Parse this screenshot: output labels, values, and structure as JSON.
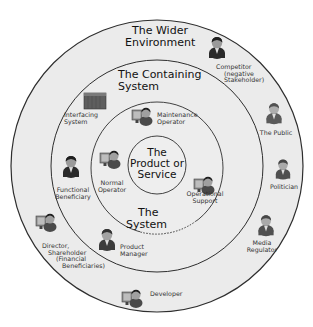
{
  "diagram": {
    "type": "onion-stakeholder-diagram",
    "colors": {
      "background": "#ffffff",
      "ring_fill": "#ebebeb",
      "ring_stroke": "#333333",
      "person_dark": "#2a2a2a",
      "person_mid": "#5a5a5a",
      "face": "#9a9a9a",
      "computer": "#7a7a7a"
    },
    "rings": [
      {
        "id": "wider",
        "title_line1": "The Wider",
        "title_line2": "Environment"
      },
      {
        "id": "containing",
        "title_line1": "The Containing",
        "title_line2": "System"
      },
      {
        "id": "system",
        "title_line1": "The",
        "title_line2": "System"
      },
      {
        "id": "core",
        "title_line1": "The",
        "title_line2": "Product or",
        "title_line3": "Service"
      }
    ],
    "stakeholders": {
      "competitor": {
        "line1": "Competitor",
        "line2": "(negative",
        "line3": "Stakeholder)",
        "icon": "person-icon"
      },
      "public": {
        "line1": "The Public",
        "icon": "person-icon"
      },
      "politician": {
        "line1": "Politician",
        "icon": "person-icon"
      },
      "media_regulator": {
        "line1": "Media",
        "line2": "Regulator",
        "icon": "person-icon"
      },
      "developer": {
        "line1": "Developer",
        "icon": "person-at-computer-icon"
      },
      "director": {
        "line1": "Director,",
        "line2": "Shareholder",
        "line3": "(Financial",
        "line4": "Beneficiaries)",
        "icon": "person-icon"
      },
      "interfacing_system": {
        "line1": "Interfacing",
        "line2": "System",
        "icon": "box-system-icon"
      },
      "functional_beneficiary": {
        "line1": "Functional",
        "line2": "Beneficiary",
        "icon": "person-icon"
      },
      "product_manager": {
        "line1": "Product",
        "line2": "Manager",
        "icon": "person-icon"
      },
      "maintenance_operator": {
        "line1": "Maintenance",
        "line2": "Operator",
        "icon": "person-at-computer-icon"
      },
      "normal_operator": {
        "line1": "Normal",
        "line2": "Operator",
        "icon": "person-at-computer-icon"
      },
      "operational_support": {
        "line1": "Operational",
        "line2": "Support",
        "icon": "person-at-computer-icon"
      }
    }
  }
}
